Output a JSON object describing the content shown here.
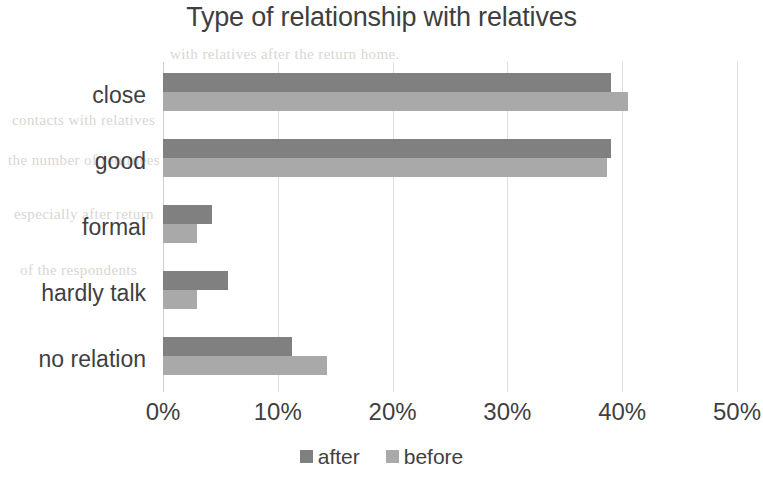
{
  "chart_data": {
    "type": "bar",
    "orientation": "horizontal",
    "title": "Type of relationship with relatives",
    "xlabel": "",
    "ylabel": "",
    "categories": [
      "close",
      "good",
      "formal",
      "hardly talk",
      "no relation"
    ],
    "series": [
      {
        "name": "after",
        "color": "#808080",
        "values": [
          39.0,
          39.0,
          4.3,
          5.7,
          11.2
        ]
      },
      {
        "name": "before",
        "color": "#a9a9a9",
        "values": [
          40.5,
          38.7,
          3.0,
          3.0,
          14.3
        ]
      }
    ],
    "xlim": [
      0,
      50
    ],
    "xticks": [
      0,
      10,
      20,
      30,
      40,
      50
    ],
    "xtick_labels": [
      "0%",
      "10%",
      "20%",
      "30%",
      "40%",
      "50%"
    ],
    "grid": true,
    "grid_axis": "x",
    "legend_position": "bottom",
    "units": "percent"
  },
  "legend": {
    "items": [
      {
        "label": "after",
        "color": "#808080"
      },
      {
        "label": "before",
        "color": "#a9a9a9"
      }
    ]
  },
  "background_ghost_text": [
    "with relatives after the return home.",
    "contacts with relatives",
    "the number of returnees",
    "especially after return",
    "of the respondents"
  ],
  "colors": {
    "after_bar": "#808080",
    "before_bar": "#a9a9a9",
    "gridline": "#dedede",
    "text": "#3f3f3f",
    "background": "#ffffff"
  }
}
